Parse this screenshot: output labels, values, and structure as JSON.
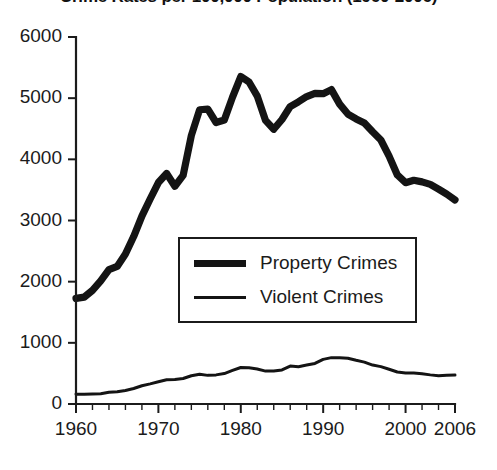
{
  "chart_data": {
    "type": "line",
    "title": "Crime Rates per 100,000 Population (1960-2006)",
    "xlabel": "",
    "ylabel": "",
    "xlim": [
      1960,
      2006
    ],
    "ylim": [
      0,
      6000
    ],
    "grid": false,
    "legend_position": "center",
    "yticks": [
      "0",
      "1000",
      "2000",
      "3000",
      "4000",
      "5000",
      "6000"
    ],
    "ytick_values": [
      0,
      1000,
      2000,
      3000,
      4000,
      5000,
      6000
    ],
    "xticks": [
      "1960",
      "1970",
      "1980",
      "1990",
      "2000",
      "2006"
    ],
    "xtick_values": [
      1960,
      1970,
      1980,
      1990,
      2000,
      2006
    ],
    "x": [
      1960,
      1961,
      1962,
      1963,
      1964,
      1965,
      1966,
      1967,
      1968,
      1969,
      1970,
      1971,
      1972,
      1973,
      1974,
      1975,
      1976,
      1977,
      1978,
      1979,
      1980,
      1981,
      1982,
      1983,
      1984,
      1985,
      1986,
      1987,
      1988,
      1989,
      1990,
      1991,
      1992,
      1993,
      1994,
      1995,
      1996,
      1997,
      1998,
      1999,
      2000,
      2001,
      2002,
      2003,
      2004,
      2005,
      2006
    ],
    "series": [
      {
        "name": "Property Crimes",
        "style": "thick",
        "color": "#141414",
        "values": [
          1726,
          1747,
          1857,
          2012,
          2198,
          2249,
          2451,
          2737,
          3071,
          3351,
          3621,
          3769,
          3561,
          3737,
          4390,
          4811,
          4820,
          4602,
          4643,
          5017,
          5353,
          5264,
          5033,
          4637,
          4492,
          4651,
          4863,
          4940,
          5027,
          5078,
          5073,
          5140,
          4903,
          4740,
          4660,
          4593,
          4451,
          4316,
          4053,
          3744,
          3618,
          3658,
          3631,
          3591,
          3514,
          3432,
          3335
        ]
      },
      {
        "name": "Violent Crimes",
        "style": "thin",
        "color": "#141414",
        "values": [
          161,
          158,
          162,
          168,
          191,
          200,
          220,
          254,
          298,
          329,
          364,
          396,
          401,
          417,
          461,
          487,
          468,
          476,
          498,
          549,
          597,
          594,
          571,
          538,
          539,
          557,
          620,
          610,
          637,
          663,
          730,
          758,
          758,
          747,
          714,
          685,
          637,
          611,
          568,
          523,
          507,
          505,
          495,
          476,
          463,
          469,
          474
        ]
      }
    ]
  },
  "legend": {
    "items": [
      {
        "label": "Property Crimes",
        "style": "thick"
      },
      {
        "label": "Violent Crimes",
        "style": "thin"
      }
    ]
  }
}
